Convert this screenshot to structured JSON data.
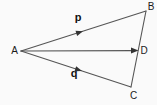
{
  "diagram": {
    "background_color": "#fafafa",
    "line_color": "#555555",
    "text_color": "#1a1a1a",
    "points": {
      "a": {
        "label": "A"
      },
      "b": {
        "label": "B"
      },
      "c": {
        "label": "C"
      },
      "d": {
        "label": "D"
      }
    },
    "vectors": {
      "p": {
        "label": "p"
      },
      "q": {
        "label": "q"
      }
    }
  }
}
